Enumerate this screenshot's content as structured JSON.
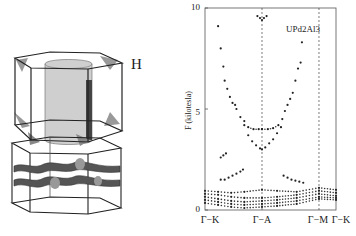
{
  "figure": {
    "left_panel": {
      "description": "Fermi surface sheets in hexagonal Brillouin zone",
      "sheet_label": "H"
    },
    "right_panel": {
      "compound_label": "UPd2Al3",
      "y_axis_label": "F (kilotesla)",
      "y_ticks": [
        "0",
        "5",
        "10"
      ],
      "x_ticks": [
        "Γ−K",
        "Γ−A",
        "Γ−M",
        "Γ−K"
      ]
    }
  },
  "chart_data": {
    "type": "scatter",
    "title": "UPd2Al3",
    "xlabel": "",
    "ylabel": "F (kilotesla)",
    "ylim": [
      0,
      10
    ],
    "xlim": [
      0,
      1
    ],
    "grid": false,
    "x_tick_positions": [
      0.0,
      0.435,
      0.87,
      1.0
    ],
    "x_tick_labels": [
      "Γ−K",
      "Γ−A",
      "Γ−M",
      "Γ−K"
    ],
    "vertical_dashed_lines": [
      0.435,
      0.87
    ],
    "series": [
      {
        "name": "high-frequency branch (left arm)",
        "points": [
          [
            0.1,
            9.1
          ],
          [
            0.12,
            8.0
          ],
          [
            0.14,
            7.1
          ],
          [
            0.15,
            6.4
          ],
          [
            0.17,
            6.0
          ],
          [
            0.19,
            5.6
          ],
          [
            0.21,
            5.3
          ],
          [
            0.23,
            5.2
          ],
          [
            0.24,
            5.0
          ],
          [
            0.27,
            4.6
          ],
          [
            0.3,
            4.4
          ],
          [
            0.33,
            4.1
          ],
          [
            0.37,
            4.0
          ],
          [
            0.41,
            4.0
          ],
          [
            0.435,
            4.0
          ]
        ]
      },
      {
        "name": "high-frequency branch (right arm)",
        "points": [
          [
            0.435,
            4.0
          ],
          [
            0.48,
            4.0
          ],
          [
            0.52,
            4.05
          ],
          [
            0.56,
            4.2
          ],
          [
            0.59,
            4.5
          ],
          [
            0.61,
            4.9
          ],
          [
            0.63,
            5.2
          ],
          [
            0.65,
            5.5
          ],
          [
            0.67,
            5.8
          ],
          [
            0.69,
            6.4
          ],
          [
            0.71,
            7.0
          ],
          [
            0.73,
            7.3
          ],
          [
            0.74,
            8.3
          ]
        ]
      },
      {
        "name": "lower U branch",
        "points": [
          [
            0.3,
            4.2
          ],
          [
            0.33,
            3.7
          ],
          [
            0.36,
            3.4
          ],
          [
            0.39,
            3.2
          ],
          [
            0.42,
            3.05
          ],
          [
            0.435,
            3.0
          ],
          [
            0.46,
            3.1
          ],
          [
            0.49,
            3.3
          ],
          [
            0.52,
            3.5
          ],
          [
            0.55,
            3.8
          ],
          [
            0.58,
            4.1
          ]
        ]
      },
      {
        "name": "top cluster near Γ−A",
        "points": [
          [
            0.4,
            9.6
          ],
          [
            0.42,
            9.5
          ],
          [
            0.435,
            9.4
          ],
          [
            0.45,
            9.5
          ],
          [
            0.47,
            9.6
          ]
        ]
      },
      {
        "name": "isolated ~2.7 kT",
        "points": [
          [
            0.12,
            2.6
          ],
          [
            0.14,
            2.7
          ],
          [
            0.16,
            2.8
          ]
        ]
      },
      {
        "name": "~1.5 kT left",
        "points": [
          [
            0.12,
            1.5
          ],
          [
            0.15,
            1.5
          ],
          [
            0.18,
            1.6
          ],
          [
            0.21,
            1.7
          ],
          [
            0.24,
            1.8
          ],
          [
            0.27,
            1.9
          ],
          [
            0.29,
            2.0
          ]
        ]
      },
      {
        "name": "~1.5 kT right",
        "points": [
          [
            0.6,
            1.7
          ],
          [
            0.63,
            1.6
          ],
          [
            0.66,
            1.5
          ],
          [
            0.69,
            1.45
          ],
          [
            0.72,
            1.4
          ],
          [
            0.75,
            1.35
          ]
        ]
      },
      {
        "name": "low band 1",
        "points": [
          [
            0.0,
            0.95
          ],
          [
            0.1,
            0.9
          ],
          [
            0.2,
            0.85
          ],
          [
            0.3,
            0.9
          ],
          [
            0.435,
            1.0
          ],
          [
            0.55,
            0.95
          ],
          [
            0.7,
            0.9
          ],
          [
            0.87,
            1.1
          ],
          [
            1.0,
            1.0
          ]
        ]
      },
      {
        "name": "low band 2",
        "points": [
          [
            0.0,
            0.8
          ],
          [
            0.1,
            0.75
          ],
          [
            0.2,
            0.65
          ],
          [
            0.3,
            0.6
          ],
          [
            0.435,
            0.6
          ],
          [
            0.55,
            0.65
          ],
          [
            0.7,
            0.75
          ],
          [
            0.87,
            0.95
          ],
          [
            1.0,
            0.85
          ]
        ]
      },
      {
        "name": "low band 3",
        "points": [
          [
            0.0,
            0.65
          ],
          [
            0.1,
            0.55
          ],
          [
            0.2,
            0.45
          ],
          [
            0.3,
            0.4
          ],
          [
            0.435,
            0.45
          ],
          [
            0.55,
            0.5
          ],
          [
            0.7,
            0.6
          ],
          [
            0.87,
            0.8
          ],
          [
            1.0,
            0.7
          ]
        ]
      },
      {
        "name": "low band 4",
        "points": [
          [
            0.0,
            0.5
          ],
          [
            0.1,
            0.4
          ],
          [
            0.2,
            0.3
          ],
          [
            0.3,
            0.25
          ],
          [
            0.435,
            0.3
          ],
          [
            0.55,
            0.35
          ],
          [
            0.7,
            0.45
          ],
          [
            0.87,
            0.65
          ],
          [
            1.0,
            0.6
          ]
        ]
      },
      {
        "name": "low band 5",
        "points": [
          [
            0.0,
            0.35
          ],
          [
            0.1,
            0.25
          ],
          [
            0.2,
            0.15
          ],
          [
            0.3,
            0.1
          ],
          [
            0.435,
            0.15
          ],
          [
            0.55,
            0.2
          ],
          [
            0.7,
            0.3
          ],
          [
            0.87,
            0.55
          ],
          [
            1.0,
            0.5
          ]
        ]
      }
    ]
  }
}
